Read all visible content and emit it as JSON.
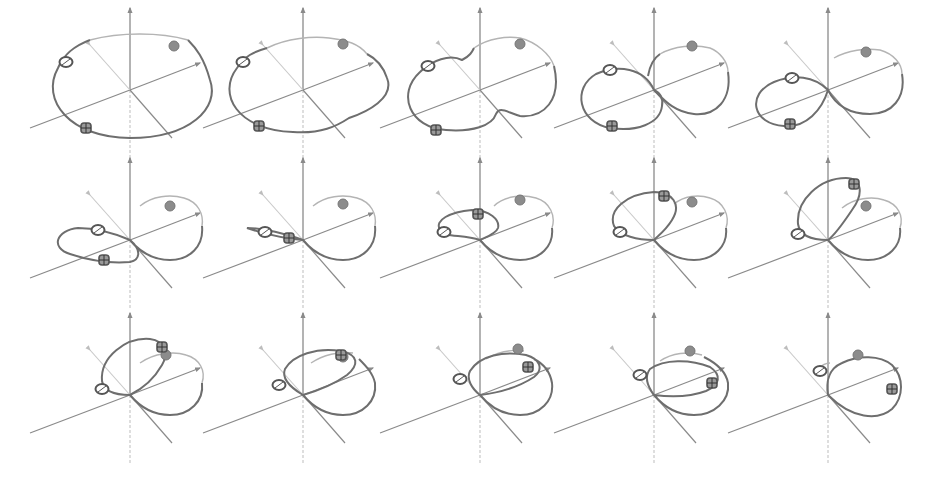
{
  "figure": {
    "layout": {
      "rows": 3,
      "columns": 5
    },
    "colors": {
      "background": "#ffffff",
      "axis": "#8a8a8a",
      "axis_faint": "#c8c8c8",
      "loop": "#6e6e6e",
      "loop_back": "#b4b4b4",
      "marker_stroke": "#555555",
      "marker_fill_dark": "#8c8c8c"
    },
    "markers": [
      {
        "name": "open-ring-marker",
        "shape": "open ellipse with slash"
      },
      {
        "name": "cross-square-marker",
        "shape": "square with cross"
      },
      {
        "name": "filled-disk-marker",
        "shape": "filled circle"
      }
    ],
    "panels": [
      {
        "index": 1,
        "row": 1,
        "col": 1,
        "cx": 130,
        "cy": 90,
        "stage": "flat-ellipse"
      },
      {
        "index": 2,
        "row": 1,
        "col": 2,
        "cx": 303,
        "cy": 90,
        "stage": "ellipse-dent"
      },
      {
        "index": 3,
        "row": 1,
        "col": 3,
        "cx": 480,
        "cy": 90,
        "stage": "pinching"
      },
      {
        "index": 4,
        "row": 1,
        "col": 4,
        "cx": 654,
        "cy": 90,
        "stage": "figure-eight"
      },
      {
        "index": 5,
        "row": 1,
        "col": 5,
        "cx": 828,
        "cy": 90,
        "stage": "figure-eight-crossed"
      },
      {
        "index": 6,
        "row": 2,
        "col": 1,
        "cx": 130,
        "cy": 240,
        "stage": "left-lobe-shrinking"
      },
      {
        "index": 7,
        "row": 2,
        "col": 2,
        "cx": 303,
        "cy": 240,
        "stage": "left-lobe-collapsed"
      },
      {
        "index": 8,
        "row": 2,
        "col": 3,
        "cx": 480,
        "cy": 240,
        "stage": "left-lobe-lifting"
      },
      {
        "index": 9,
        "row": 2,
        "col": 4,
        "cx": 654,
        "cy": 240,
        "stage": "left-lobe-raised"
      },
      {
        "index": 10,
        "row": 2,
        "col": 5,
        "cx": 828,
        "cy": 240,
        "stage": "left-lobe-vertical"
      },
      {
        "index": 11,
        "row": 3,
        "col": 1,
        "cx": 130,
        "cy": 395,
        "stage": "lobe-tilting-over"
      },
      {
        "index": 12,
        "row": 3,
        "col": 2,
        "cx": 303,
        "cy": 395,
        "stage": "lobe-folding"
      },
      {
        "index": 13,
        "row": 3,
        "col": 3,
        "cx": 480,
        "cy": 395,
        "stage": "lobes-overlapping"
      },
      {
        "index": 14,
        "row": 3,
        "col": 4,
        "cx": 654,
        "cy": 395,
        "stage": "lobes-nearly-merged"
      },
      {
        "index": 15,
        "row": 3,
        "col": 5,
        "cx": 828,
        "cy": 395,
        "stage": "single-loop"
      }
    ]
  }
}
